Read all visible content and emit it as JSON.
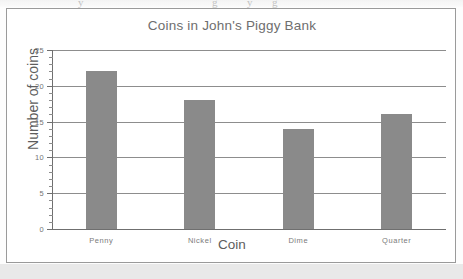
{
  "chart_data": {
    "type": "bar",
    "title": "Coins in John's Piggy Bank",
    "xlabel": "Coin",
    "ylabel": "Number of coins",
    "categories": [
      "Penny",
      "Nickel",
      "Dime",
      "Quarter"
    ],
    "values": [
      22,
      18,
      14,
      16
    ],
    "ylim": [
      0,
      25
    ],
    "ytick_labels": [
      "0",
      "5",
      "10",
      "15",
      "20",
      "25"
    ],
    "ytick_values": [
      0,
      5,
      10,
      15,
      20,
      25
    ],
    "ytick_minor_step": 1,
    "grid": "horizontal",
    "legend": "none",
    "bar_color": "#8a8a8a",
    "axis_color": "#6f6f6f",
    "grid_color": "#8d8d8d",
    "title_color": "#6e6e6e",
    "tick_label_color": "#757575"
  },
  "figure": {
    "border_color": "#9a9a9a",
    "background_color": "#ffffff",
    "scan_band_color": "#e9e9e9"
  }
}
